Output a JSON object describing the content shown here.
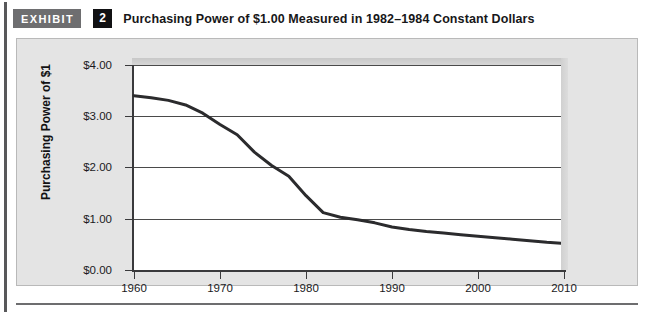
{
  "header": {
    "badge_label": "EXHIBIT",
    "exhibit_number": "2",
    "title": "Purchasing Power of $1.00 Measured in 1982–1984 Constant Dollars"
  },
  "colors": {
    "badge_bg": "#6e6e70",
    "number_bg": "#111113",
    "frame_bg": "#e4e4e4",
    "plot_bg": "#ffffff",
    "line": "#2b2b2d",
    "gridline": "#4a4a4a",
    "axis": "#3a3a3c"
  },
  "chart_data": {
    "type": "line",
    "title": "Purchasing Power of $1.00 Measured in 1982–1984 Constant Dollars",
    "xlabel": "",
    "ylabel": "Purchasing Power of $1",
    "xlim": [
      1958,
      2012
    ],
    "ylim": [
      0,
      4
    ],
    "grid": true,
    "legend": "none",
    "x_ticks": [
      1960,
      1970,
      1980,
      1990,
      2000,
      2010
    ],
    "x_tick_labels": [
      "1960",
      "1970",
      "1980",
      "1990",
      "2000",
      "2010"
    ],
    "y_ticks": [
      0,
      1,
      2,
      3,
      4
    ],
    "y_tick_labels": [
      "$0.00",
      "$1.00",
      "$2.00",
      "$3.00",
      "$4.00"
    ],
    "series": [
      {
        "name": "Purchasing Power of $1",
        "x": [
          1960,
          1962,
          1964,
          1966,
          1968,
          1970,
          1972,
          1974,
          1976,
          1978,
          1980,
          1982,
          1984,
          1986,
          1988,
          1990,
          1992,
          1994,
          1996,
          1998,
          2000,
          2002,
          2004,
          2006,
          2008,
          2010
        ],
        "values": [
          3.4,
          3.36,
          3.31,
          3.22,
          3.06,
          2.84,
          2.64,
          2.3,
          2.04,
          1.83,
          1.45,
          1.12,
          1.03,
          0.98,
          0.92,
          0.84,
          0.79,
          0.75,
          0.72,
          0.69,
          0.66,
          0.63,
          0.6,
          0.57,
          0.54,
          0.52
        ]
      }
    ]
  },
  "axis": {
    "y_labels": [
      "$4.00",
      "$3.00",
      "$2.00",
      "$1.00",
      "$0.00"
    ],
    "x_labels": [
      "1960",
      "1970",
      "1980",
      "1990",
      "2000",
      "2010"
    ],
    "y_title": "Purchasing Power of $1"
  }
}
